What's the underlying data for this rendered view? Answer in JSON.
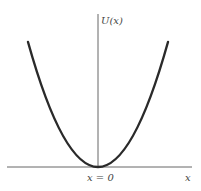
{
  "diagram": {
    "y_axis_label": "U(x)",
    "x_axis_label": "x",
    "origin_label": "x = 0",
    "curve": "parabola",
    "colors": {
      "curve": "#2a2a2a",
      "axis": "#555555",
      "text": "#444444"
    }
  }
}
